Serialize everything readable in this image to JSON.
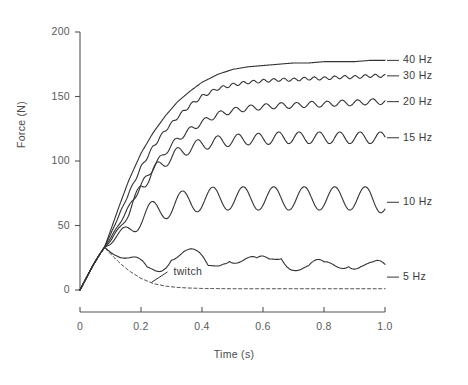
{
  "chart_data": {
    "type": "line",
    "title": "",
    "xlabel": "Time (s)",
    "ylabel": "Force (N)",
    "xlim": [
      0,
      1.06
    ],
    "ylim": [
      0,
      200
    ],
    "grid": false,
    "legend_position": "right-inline",
    "xticks": [
      0,
      0.2,
      0.4,
      0.6,
      0.8,
      1.0
    ],
    "xtick_labels": [
      "0",
      "0.2",
      "0.4",
      "0.6",
      "0.8",
      "1.0"
    ],
    "yticks": [
      0,
      50,
      100,
      150,
      200
    ],
    "ytick_labels": [
      "0",
      "50",
      "100",
      "150",
      "200"
    ],
    "line_color": "#333333",
    "axis_color": "#555555",
    "annotations": [
      {
        "text": "twitch",
        "x": 0.3,
        "y": 14
      }
    ],
    "series": [
      {
        "name": "40 Hz",
        "label": "40 Hz",
        "style": "solid",
        "plateau": 178,
        "label_y": 178,
        "ripple_amp": 0.0,
        "ripple_freq": 40,
        "rise_tau": 0.115,
        "x": [
          0,
          0.02,
          0.04,
          0.06,
          0.08,
          0.1,
          0.13,
          0.16,
          0.2,
          0.24,
          0.28,
          0.32,
          0.36,
          0.4,
          0.45,
          0.5,
          0.55,
          0.6,
          0.65,
          0.7,
          0.75,
          0.8,
          0.85,
          0.9,
          0.95,
          1.0
        ],
        "y": [
          0,
          9,
          18,
          26,
          33,
          46,
          66,
          85,
          106,
          122,
          135,
          146,
          154,
          161,
          167,
          171,
          173,
          174,
          175,
          176,
          176,
          177,
          177,
          177,
          178,
          178
        ]
      },
      {
        "name": "30 Hz",
        "label": "30 Hz",
        "style": "solid",
        "plateau": 166,
        "label_y": 166,
        "ripple_amp": 1.2,
        "ripple_freq": 30,
        "rise_tau": 0.135,
        "x": [
          0,
          0.02,
          0.04,
          0.06,
          0.08,
          0.1,
          0.13,
          0.16,
          0.2,
          0.24,
          0.28,
          0.32,
          0.36,
          0.4,
          0.45,
          0.5,
          0.55,
          0.6,
          0.65,
          0.7,
          0.75,
          0.8,
          0.85,
          0.9,
          0.95,
          1.0
        ],
        "y": [
          0,
          9,
          18,
          26,
          33,
          43,
          59,
          75,
          95,
          111,
          124,
          134,
          143,
          150,
          156,
          159,
          161,
          162,
          163,
          163,
          164,
          164,
          165,
          165,
          166,
          166
        ]
      },
      {
        "name": "20 Hz",
        "label": "20 Hz",
        "style": "solid",
        "plateau": 146,
        "label_y": 146,
        "ripple_amp": 2.2,
        "ripple_freq": 20,
        "rise_tau": 0.155,
        "x": [
          0,
          0.02,
          0.04,
          0.06,
          0.08,
          0.1,
          0.13,
          0.16,
          0.2,
          0.24,
          0.28,
          0.32,
          0.36,
          0.4,
          0.45,
          0.5,
          0.55,
          0.6,
          0.65,
          0.7,
          0.75,
          0.8,
          0.85,
          0.9,
          0.95,
          1.0
        ],
        "y": [
          0,
          9,
          18,
          26,
          33,
          40,
          52,
          64,
          81,
          95,
          107,
          117,
          124,
          130,
          136,
          139,
          141,
          142,
          143,
          143,
          144,
          144,
          145,
          145,
          146,
          146
        ]
      },
      {
        "name": "15 Hz",
        "label": "15 Hz",
        "style": "solid",
        "plateau": 118,
        "label_y": 118,
        "ripple_amp": 4.5,
        "ripple_freq": 15,
        "rise_tau": 0.15,
        "x": [
          0,
          0.02,
          0.04,
          0.06,
          0.08,
          0.1,
          0.13,
          0.16,
          0.2,
          0.24,
          0.28,
          0.32,
          0.36,
          0.4,
          0.45,
          0.5,
          0.55,
          0.6,
          0.65,
          0.7,
          0.75,
          0.8,
          0.85,
          0.9,
          0.95,
          1.0
        ],
        "y": [
          0,
          9,
          18,
          26,
          33,
          38,
          48,
          60,
          80,
          92,
          100,
          106,
          110,
          113,
          115,
          116,
          117,
          117,
          118,
          118,
          118,
          118,
          118,
          118,
          118,
          118
        ]
      },
      {
        "name": "10 Hz",
        "label": "10 Hz",
        "style": "solid",
        "plateau": 71,
        "label_y": 68,
        "ripple_amp": 9,
        "ripple_freq": 10,
        "rise_tau": 0.16,
        "peak_force": 80,
        "trough_force": 62,
        "x": [
          0,
          0.02,
          0.04,
          0.06,
          0.08,
          0.1,
          0.13,
          0.16,
          0.2,
          0.24,
          0.28,
          0.32,
          0.36,
          0.4,
          0.45,
          0.5,
          0.55,
          0.6,
          0.65,
          0.7,
          0.75,
          0.8,
          0.85,
          0.9,
          0.95,
          1.0
        ],
        "y": [
          0,
          9,
          18,
          26,
          33,
          36,
          42,
          48,
          56,
          60,
          64,
          67,
          69,
          70,
          71,
          71,
          71,
          71,
          71,
          71,
          71,
          71,
          71,
          71,
          71,
          68
        ]
      },
      {
        "name": "5 Hz",
        "label": "5 Hz",
        "style": "solid",
        "plateau": 21,
        "label_y": 10,
        "ripple_amp": 11,
        "ripple_freq": 5,
        "rise_tau": 0.1,
        "peak_force": 33,
        "trough_force": 10,
        "x": [
          0,
          0.02,
          0.04,
          0.06,
          0.08,
          0.12,
          0.16,
          0.2,
          0.22,
          0.26,
          0.3,
          0.34,
          0.38,
          0.42,
          0.47,
          0.49,
          0.53,
          0.58,
          0.62,
          0.66,
          0.7,
          0.75,
          0.8,
          0.84,
          0.88,
          0.92,
          0.96,
          1.0
        ],
        "y": [
          0,
          9,
          18,
          26,
          33,
          28,
          20,
          14,
          13,
          22,
          33,
          28,
          20,
          14,
          30,
          33,
          24,
          14,
          19,
          32,
          25,
          14,
          12,
          20,
          29,
          23,
          14,
          10
        ]
      },
      {
        "name": "twitch",
        "label": "twitch",
        "style": "dashed",
        "plateau": 1,
        "label_y": 14,
        "ripple_amp": 0,
        "ripple_freq": 0,
        "peak_force": 33,
        "x": [
          0,
          0.02,
          0.04,
          0.06,
          0.08,
          0.1,
          0.13,
          0.16,
          0.2,
          0.24,
          0.28,
          0.32,
          0.36,
          0.4,
          0.5,
          0.6,
          0.7,
          0.8,
          0.9,
          1.0
        ],
        "y": [
          0,
          9,
          18,
          26,
          33,
          28,
          21,
          15,
          9,
          5,
          3,
          2,
          1.5,
          1.2,
          1,
          1,
          1,
          1,
          1,
          1
        ]
      }
    ]
  }
}
